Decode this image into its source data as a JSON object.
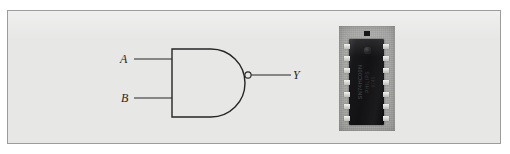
{
  "figure": {
    "kind": "logic-gate-diagram-with-ic-photo",
    "background_color": "#ffffff",
    "panel_color": "#e7e7e6",
    "panel_border_color": "#9c9c9c",
    "line_color": "#262626"
  },
  "gate": {
    "type": "NAND",
    "symbol_style": "distinctive-shape",
    "has_inversion_bubble": true,
    "inputs": [
      {
        "id": "input-a",
        "label": "A"
      },
      {
        "id": "input-b",
        "label": "B"
      }
    ],
    "output": {
      "id": "output-y",
      "label": "Y"
    }
  },
  "ic": {
    "package": "DIP-14",
    "pin_count": 14,
    "pins_per_side": 7,
    "body_color": "#17171a",
    "pin_color": "#e8e8e4",
    "photo_background_color": "#aaaaa8",
    "marking_line_1": "SN74HC00N",
    "marking_line_2": "PHILIPS",
    "marking_line_3": "9740",
    "has_pin1_dimple": true
  }
}
